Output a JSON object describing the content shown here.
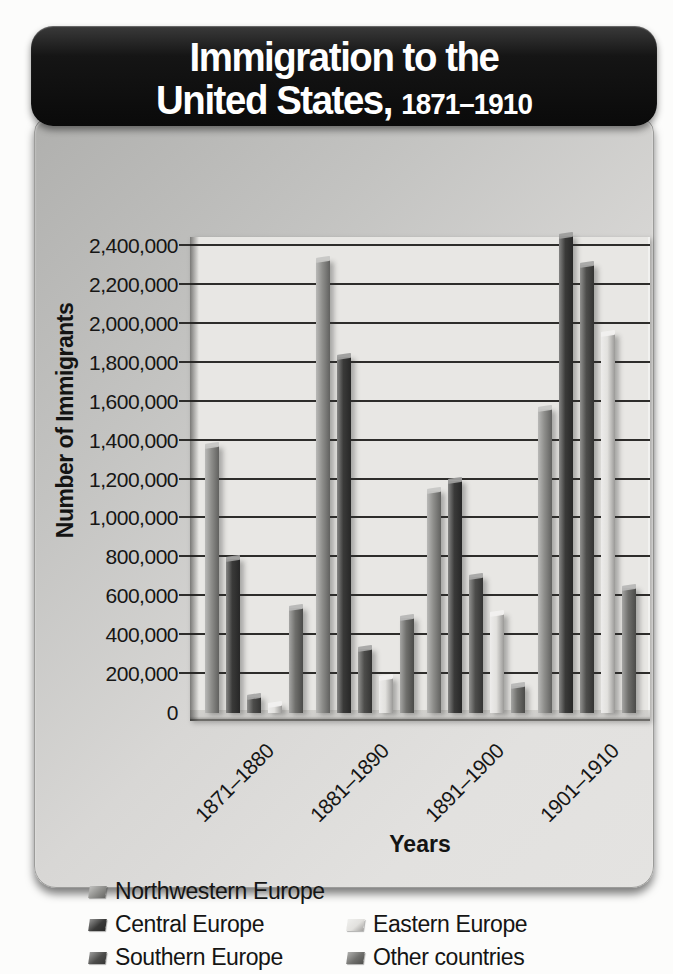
{
  "header": {
    "title_line1": "Immigration to the",
    "title_line2_main": "United States,",
    "title_line2_sub": "1871–1910"
  },
  "chart_data": {
    "type": "bar",
    "categories": [
      "1871–1880",
      "1881–1890",
      "1891–1900",
      "1901–1910"
    ],
    "series": [
      {
        "name": "Northwestern Europe",
        "color": "#8e8e8b",
        "values": [
          1370000,
          2330000,
          1140000,
          1560000
        ]
      },
      {
        "name": "Central Europe",
        "color": "#3a3a39",
        "values": [
          790000,
          1830000,
          1190000,
          2450000
        ]
      },
      {
        "name": "Southern Europe",
        "color": "#4d4d4b",
        "values": [
          80000,
          330000,
          700000,
          2300000
        ]
      },
      {
        "name": "Eastern Europe",
        "color": "#e2e1de",
        "values": [
          40000,
          180000,
          510000,
          1950000
        ]
      },
      {
        "name": "Other countries",
        "color": "#6f6f6c",
        "values": [
          540000,
          490000,
          140000,
          640000
        ]
      }
    ],
    "xlabel": "Years",
    "ylabel": "Number of Immigrants",
    "ylim": [
      0,
      2400000
    ],
    "ytick_step": 200000,
    "yticks": [
      "2,400,000",
      "2,200,000",
      "2,000,000",
      "1,800,000",
      "1,600,000",
      "1,400,000",
      "1,200,000",
      "1,000,000",
      "800,000",
      "600,000",
      "400,000",
      "200,000",
      "0"
    ],
    "grid": true,
    "legend_position": "bottom"
  }
}
